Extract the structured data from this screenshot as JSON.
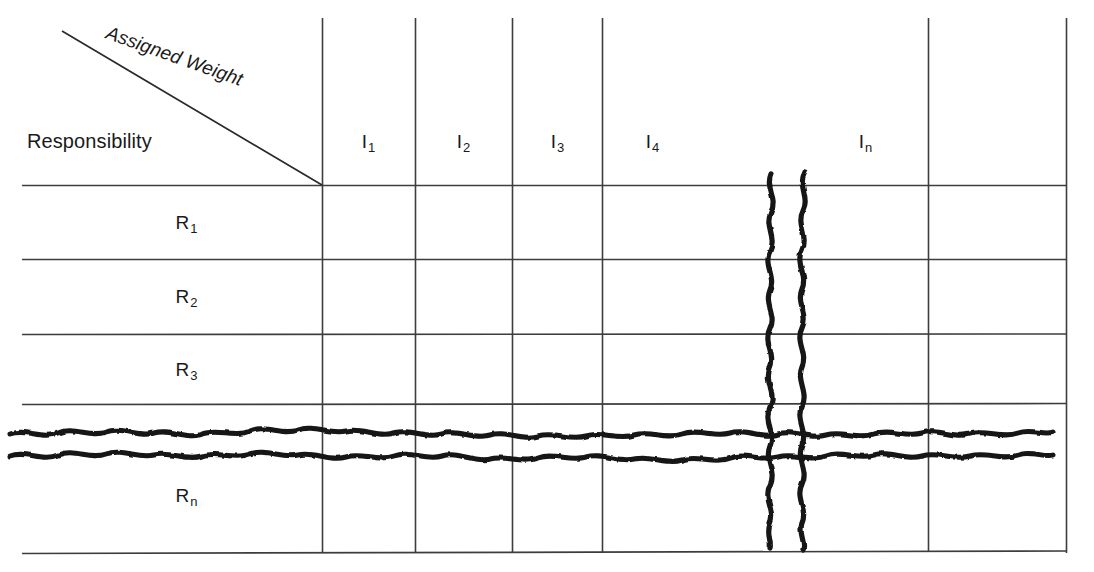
{
  "figure": {
    "kind": "responsibility-weight-matrix",
    "corner_cell": {
      "row_axis_label": "Responsibility",
      "column_axis_label": "Assigned Weight"
    },
    "columns": [
      {
        "base": "I",
        "subscript": "1",
        "x": 368
      },
      {
        "base": "I",
        "subscript": "2",
        "x": 463
      },
      {
        "base": "I",
        "subscript": "3",
        "x": 557
      },
      {
        "base": "I",
        "subscript": "4",
        "x": 652
      },
      {
        "base": "I",
        "subscript": "n",
        "x": 865
      }
    ],
    "rows": [
      {
        "base": "R",
        "subscript": "1",
        "x": 186,
        "y": 213
      },
      {
        "base": "R",
        "subscript": "2",
        "x": 186,
        "y": 287
      },
      {
        "base": "R",
        "subscript": "3",
        "x": 186,
        "y": 360
      },
      {
        "base": "R",
        "subscript": "n",
        "x": 186,
        "y": 486
      }
    ],
    "cells": [],
    "break_marks": {
      "vertical": {
        "count": 2,
        "x_positions": [
          771,
          803
        ],
        "top": 172,
        "bottom": 549
      },
      "horizontal": {
        "count": 2,
        "y_positions": [
          434,
          456
        ],
        "left": 8,
        "right": 1053
      }
    },
    "geometry": {
      "v_lines_x": [
        322,
        415,
        512,
        602,
        928,
        1067
      ],
      "v_line_top": 18,
      "v_line_bottom": 552,
      "h_lines_y": [
        185,
        259,
        334,
        404,
        552
      ],
      "h_line_left": 22,
      "h_line_right": 1067,
      "diagonal": {
        "x1": 62,
        "y1": 31,
        "x2": 322,
        "y2": 185
      }
    },
    "colors": {
      "ink": "#1a1a1a",
      "rule": "#3d3d3d",
      "background": "#ffffff"
    }
  }
}
